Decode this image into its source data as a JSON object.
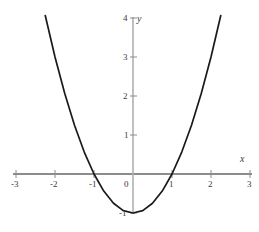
{
  "figure": {
    "width": 259,
    "height": 232,
    "background_color": "#ffffff",
    "axis_color": "#8c8c8c",
    "curve_color": "#1a1a1a",
    "label_color": "#3a3a3a"
  },
  "axes": {
    "x_axis_label": "x",
    "y_axis_label": "y",
    "x_ticks": [
      {
        "value": -3,
        "label": "-3",
        "px": 16
      },
      {
        "value": -2,
        "label": "-2",
        "px": 55
      },
      {
        "value": -1,
        "label": "-1",
        "px": 94
      },
      {
        "value": 0,
        "label": "0",
        "px": 133
      },
      {
        "value": 1,
        "label": "1",
        "px": 172
      },
      {
        "value": 2,
        "label": "2",
        "px": 211
      },
      {
        "value": 3,
        "label": "3",
        "px": 250
      }
    ],
    "y_ticks": [
      {
        "value": 4,
        "label": "4",
        "px": 18
      },
      {
        "value": 3,
        "label": "3",
        "px": 57
      },
      {
        "value": 2,
        "label": "2",
        "px": 96
      },
      {
        "value": 1,
        "label": "1",
        "px": 135
      },
      {
        "value": -1,
        "label": "-1",
        "px": 213
      }
    ],
    "origin_px": {
      "x": 133,
      "y": 174
    },
    "unit_px": 39
  },
  "chart_data": {
    "type": "line",
    "title": "",
    "subtitle": "",
    "xlabel": "x",
    "ylabel": "y",
    "xlim": [
      -3,
      3
    ],
    "ylim": [
      -1.2,
      4
    ],
    "grid": false,
    "legend": "none",
    "equation": "y = x^2 - 1",
    "vertex": [
      0,
      -1
    ],
    "roots": [
      -1,
      1
    ],
    "series": [
      {
        "name": "y = x^2 - 1",
        "color": "#1a1a1a",
        "x": [
          -2.25,
          -2.0,
          -1.75,
          -1.5,
          -1.25,
          -1.0,
          -0.75,
          -0.5,
          -0.25,
          0,
          0.25,
          0.5,
          0.75,
          1.0,
          1.25,
          1.5,
          1.75,
          2.0,
          2.25
        ],
        "values": [
          4.0625,
          3.0,
          2.0625,
          1.25,
          0.5625,
          0,
          -0.4375,
          -0.75,
          -0.9375,
          -1.0,
          -0.9375,
          -0.75,
          -0.4375,
          0,
          0.5625,
          1.25,
          2.0625,
          3.0,
          4.0625
        ]
      }
    ],
    "annotations": [
      {
        "text": "x",
        "at": [
          3,
          0.25
        ],
        "style": "italic"
      },
      {
        "text": "y",
        "at": [
          0.2,
          4
        ],
        "style": "italic"
      },
      {
        "text": "-1",
        "at": [
          -0.25,
          -1.1
        ],
        "style": "normal"
      }
    ]
  }
}
